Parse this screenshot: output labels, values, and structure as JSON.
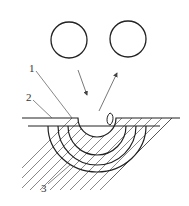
{
  "diagram": {
    "labels": [
      {
        "id": "1",
        "text": "1"
      },
      {
        "id": "2",
        "text": "2"
      },
      {
        "id": "3",
        "text": "3"
      }
    ],
    "elements": {
      "particles": [
        "left-circle",
        "right-circle"
      ],
      "arrows": [
        "incident-arrow",
        "reflected-arrow"
      ],
      "ejected_fragment": "droplet",
      "layers": 3
    },
    "colors": {
      "line": "#222222",
      "hatch": "#555555",
      "background": "#ffffff"
    }
  }
}
